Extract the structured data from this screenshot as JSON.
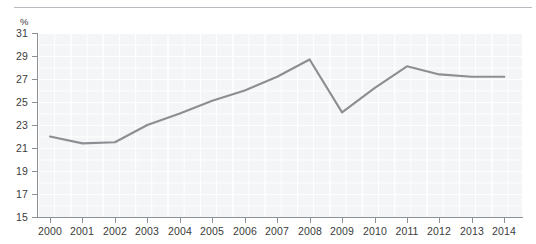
{
  "chart_data": {
    "type": "line",
    "title": "",
    "subtitle": "",
    "xlabel": "",
    "ylabel": "",
    "unit_label": "%",
    "categories": [
      "2000",
      "2001",
      "2002",
      "2003",
      "2004",
      "2005",
      "2006",
      "2007",
      "2008",
      "2009",
      "2010",
      "2011",
      "2012",
      "2013",
      "2014"
    ],
    "x": [
      2000,
      2001,
      2002,
      2003,
      2004,
      2005,
      2006,
      2007,
      2008,
      2009,
      2010,
      2011,
      2012,
      2013,
      2014
    ],
    "values": [
      22.0,
      21.4,
      21.5,
      23.0,
      24.0,
      25.1,
      26.0,
      27.2,
      28.7,
      24.1,
      26.2,
      28.1,
      27.4,
      27.2,
      27.2
    ],
    "series": [
      {
        "name": "",
        "values": [
          22.0,
          21.4,
          21.5,
          23.0,
          24.0,
          25.1,
          26.0,
          27.2,
          28.7,
          24.1,
          26.2,
          28.1,
          27.4,
          27.2,
          27.2
        ],
        "color": "#8c8f92"
      }
    ],
    "ylim": [
      15,
      31
    ],
    "yticks": [
      15,
      17,
      19,
      21,
      23,
      25,
      27,
      29,
      31
    ],
    "ytick_labels": [
      "15",
      "17",
      "19",
      "21",
      "23",
      "25",
      "27",
      "29",
      "31"
    ],
    "xlim": [
      2000,
      2014
    ],
    "grid": true,
    "legend": null,
    "annotations": []
  },
  "colors": {
    "line": "#8c8f92",
    "plot_background": "#f4f5f6",
    "gridline": "#ffffff",
    "axis": "#8c9196",
    "text": "#3b3b3b",
    "top_rule": "#b8bcc0",
    "page_background": "#ffffff"
  }
}
